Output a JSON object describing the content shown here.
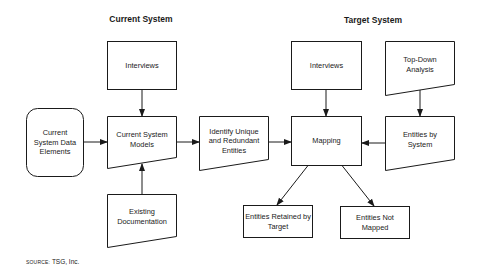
{
  "headings": {
    "current": "Current System",
    "target": "Target System"
  },
  "nodes": {
    "current_interviews": "Interviews",
    "current_data_elements": "Current System Data Elements",
    "current_models": "Current System Models",
    "existing_docs": "Existing Documentation",
    "identify_entities": "Identify Unique and Redundant Entities",
    "target_interviews": "Interviews",
    "top_down": "Top-Down Analysis",
    "mapping": "Mapping",
    "entities_by_system": "Entities by System",
    "entities_retained": "Entities Retained by Target",
    "entities_not_mapped": "Entities Not Mapped"
  },
  "edges": [
    {
      "from": "current_interviews",
      "to": "current_models"
    },
    {
      "from": "current_data_elements",
      "to": "current_models"
    },
    {
      "from": "existing_docs",
      "to": "current_models"
    },
    {
      "from": "current_models",
      "to": "identify_entities"
    },
    {
      "from": "identify_entities",
      "to": "mapping"
    },
    {
      "from": "target_interviews",
      "to": "mapping"
    },
    {
      "from": "top_down",
      "to": "entities_by_system"
    },
    {
      "from": "entities_by_system",
      "to": "mapping"
    },
    {
      "from": "mapping",
      "to": "entities_retained"
    },
    {
      "from": "mapping",
      "to": "entities_not_mapped"
    }
  ],
  "source": {
    "prefix": "SOURCE:",
    "text": "TSG, Inc."
  },
  "colors": {
    "stroke": "#1a1a1a",
    "background": "#ffffff"
  }
}
